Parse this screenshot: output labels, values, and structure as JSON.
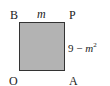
{
  "diagram": {
    "type": "shaded square on coordinate plane",
    "vertices": {
      "top_left": "B",
      "top_right": "P",
      "bottom_left": "O",
      "bottom_right": "A"
    },
    "top_side_label": "m",
    "right_side_label": {
      "constant": "9",
      "operator": "−",
      "variable": "m",
      "exponent": "2"
    },
    "colors": {
      "fill": "#b3b3b3",
      "stroke": "#333333",
      "background": "#ffffff"
    }
  }
}
